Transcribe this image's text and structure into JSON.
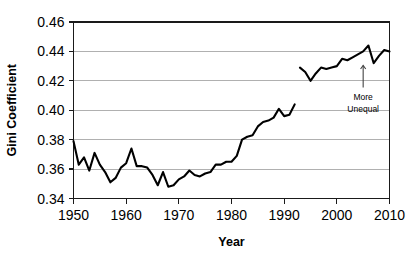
{
  "chart_data": {
    "type": "line",
    "title": "",
    "xlabel": "Year",
    "ylabel": "Gini Coefficient",
    "xlim": [
      1950,
      2010
    ],
    "ylim": [
      0.34,
      0.46
    ],
    "xticks": [
      1950,
      1960,
      1970,
      1980,
      1990,
      2000,
      2010
    ],
    "xtick_labels": [
      "1950",
      "1960",
      "1970",
      "1980",
      "1990",
      "2000",
      "2010"
    ],
    "yticks": [
      0.34,
      0.36,
      0.38,
      0.4,
      0.42,
      0.44,
      0.46
    ],
    "ytick_labels": [
      "0.34",
      "0.36",
      "0.38",
      "0.40",
      "0.42",
      "0.44",
      "0.46"
    ],
    "grid": "horizontal",
    "legend": "none",
    "line_color": "#000000",
    "gridline_color": "#b0b0b0",
    "border_color": "#1a1a1a",
    "background_color": "#ffffff",
    "annotations": [
      {
        "name": "more-unequal",
        "line1": "More",
        "line2": "Unequal",
        "arrow": "up-arrow",
        "at_x": 2005,
        "arrow_from_y": 0.4155,
        "arrow_to_y": 0.4305
      }
    ],
    "series": [
      {
        "name": "Gini coefficient (1950-1992)",
        "x": [
          1950,
          1951,
          1952,
          1953,
          1954,
          1955,
          1956,
          1957,
          1958,
          1959,
          1960,
          1961,
          1962,
          1963,
          1964,
          1965,
          1966,
          1967,
          1968,
          1969,
          1970,
          1971,
          1972,
          1973,
          1974,
          1975,
          1976,
          1977,
          1978,
          1979,
          1980,
          1981,
          1982,
          1983,
          1984,
          1985,
          1986,
          1987,
          1988,
          1989,
          1990,
          1991,
          1992
        ],
        "values": [
          0.379,
          0.363,
          0.368,
          0.359,
          0.371,
          0.363,
          0.358,
          0.351,
          0.354,
          0.361,
          0.364,
          0.374,
          0.362,
          0.362,
          0.361,
          0.356,
          0.349,
          0.358,
          0.348,
          0.349,
          0.353,
          0.355,
          0.359,
          0.356,
          0.355,
          0.357,
          0.358,
          0.363,
          0.363,
          0.365,
          0.365,
          0.369,
          0.38,
          0.382,
          0.383,
          0.389,
          0.392,
          0.393,
          0.395,
          0.401,
          0.396,
          0.397,
          0.404
        ]
      },
      {
        "name": "Gini coefficient (1993-2010)",
        "x": [
          1993,
          1994,
          1995,
          1996,
          1997,
          1998,
          1999,
          2000,
          2001,
          2002,
          2003,
          2004,
          2005,
          2006,
          2007,
          2008,
          2009,
          2010
        ],
        "values": [
          0.429,
          0.426,
          0.42,
          0.425,
          0.429,
          0.428,
          0.429,
          0.43,
          0.435,
          0.434,
          0.436,
          0.438,
          0.44,
          0.444,
          0.432,
          0.437,
          0.441,
          0.44
        ]
      }
    ]
  }
}
